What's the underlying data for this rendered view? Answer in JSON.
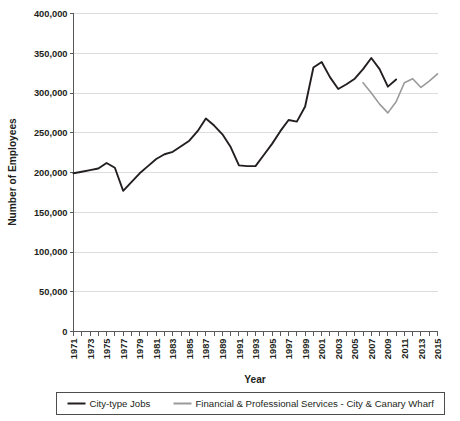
{
  "chart_data": {
    "type": "line",
    "title": "",
    "xlabel": "Year",
    "ylabel": "Number of Employees",
    "xlim": [
      1971,
      2015
    ],
    "ylim": [
      0,
      400000
    ],
    "ytick_values": [
      0,
      50000,
      100000,
      150000,
      200000,
      250000,
      300000,
      350000,
      400000
    ],
    "ytick_labels": [
      "0",
      "50,000",
      "100,000",
      "150,000",
      "200,000",
      "250,000",
      "300,000",
      "350,000",
      "400,000"
    ],
    "xtick_labels": [
      "1971",
      "1973",
      "1975",
      "1977",
      "1979",
      "1981",
      "1983",
      "1985",
      "1987",
      "1989",
      "1991",
      "1993",
      "1995",
      "1997",
      "1999",
      "2001",
      "2003",
      "2005",
      "2007",
      "2009",
      "2011",
      "2013",
      "2015"
    ],
    "xtick_all_years": [
      1971,
      1972,
      1973,
      1974,
      1975,
      1976,
      1977,
      1978,
      1979,
      1980,
      1981,
      1982,
      1983,
      1984,
      1985,
      1986,
      1987,
      1988,
      1989,
      1990,
      1991,
      1992,
      1993,
      1994,
      1995,
      1996,
      1997,
      1998,
      1999,
      2000,
      2001,
      2002,
      2003,
      2004,
      2005,
      2006,
      2007,
      2008,
      2009,
      2010,
      2011,
      2012,
      2013,
      2014,
      2015
    ],
    "grid": true,
    "grid_axis": "y",
    "legend_position": "bottom",
    "series": [
      {
        "name": "City-type Jobs",
        "color": "#231f20",
        "width": 1.9,
        "x": [
          1971,
          1972,
          1973,
          1974,
          1975,
          1976,
          1977,
          1978,
          1979,
          1980,
          1981,
          1982,
          1983,
          1984,
          1985,
          1986,
          1987,
          1988,
          1989,
          1990,
          1991,
          1992,
          1993,
          1994,
          1995,
          1996,
          1997,
          1998,
          1999,
          2000,
          2001,
          2002,
          2003,
          2004,
          2005,
          2006,
          2007,
          2008,
          2009,
          2010
        ],
        "values": [
          199000,
          201000,
          203000,
          205000,
          212000,
          206000,
          177000,
          188000,
          199000,
          208000,
          217000,
          223000,
          226000,
          233000,
          240000,
          252000,
          268000,
          259000,
          248000,
          232000,
          209000,
          208000,
          208000,
          222000,
          236000,
          252000,
          266000,
          264000,
          283000,
          332000,
          339000,
          320000,
          305000,
          311000,
          318000,
          330000,
          344000,
          330000,
          308000,
          317000
        ]
      },
      {
        "name": "Financial & Professional Services - City & Canary Wharf",
        "color": "#9a9a9a",
        "width": 1.6,
        "x": [
          2006,
          2007,
          2008,
          2009,
          2010,
          2011,
          2012,
          2013,
          2014,
          2015
        ],
        "values": [
          313000,
          300000,
          286000,
          275000,
          289000,
          313000,
          318000,
          307000,
          315000,
          324000
        ]
      }
    ]
  },
  "legend": {
    "items": [
      {
        "label": "City-type Jobs",
        "color": "#231f20"
      },
      {
        "label": "Financial & Professional Services - City & Canary Wharf",
        "color": "#9a9a9a"
      }
    ]
  }
}
